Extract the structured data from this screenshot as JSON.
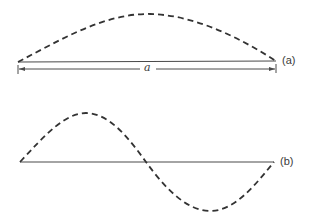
{
  "figure": {
    "type": "standing-wave-modes",
    "colors": {
      "line": "#4a4a4a",
      "dashed_curve": "#333333",
      "text": "#3a3a3a"
    },
    "parts": [
      {
        "id": "a",
        "label": "(a)",
        "description": "Fundamental mode: half-wavelength arch over span a",
        "baseline": {
          "x1": 18,
          "y1": 62,
          "x2": 276,
          "y2": 61
        },
        "curve": "half-sine, single hump above baseline",
        "dimension": {
          "label": "a",
          "x1": 18,
          "x2": 276,
          "y": 69
        }
      },
      {
        "id": "b",
        "label": "(b)",
        "description": "Second mode: full wavelength over span, crest above and trough below baseline",
        "baseline": {
          "x1": 20,
          "y1": 162,
          "x2": 274,
          "y2": 162
        },
        "curve": "full-sine, crest then trough"
      }
    ]
  }
}
